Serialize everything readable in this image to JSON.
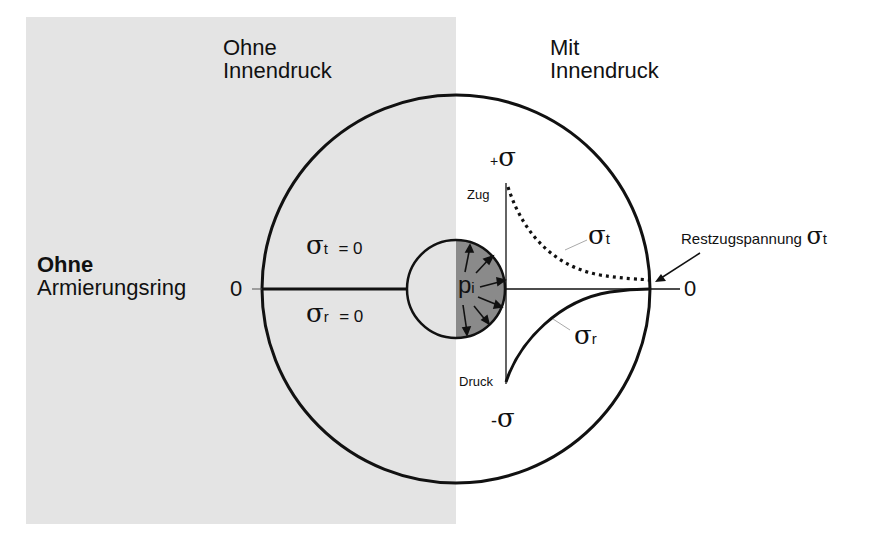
{
  "headers": {
    "left": {
      "line1": "Ohne",
      "line2": "Innendruck"
    },
    "right": {
      "line1": "Mit",
      "line2": "Innendruck"
    }
  },
  "side_label": {
    "bold": "Ohne",
    "normal": "Armierungsring"
  },
  "axis": {
    "zero_left": "0",
    "zero_right": "0",
    "plus_sign": "+",
    "minus_sign": "-",
    "sigma": "σ",
    "tension_label": "Zug",
    "compression_label": "Druck"
  },
  "left_half": {
    "sigma_t_eq": {
      "symbol": "σ",
      "sub": "t",
      "eq": "= 0"
    },
    "sigma_r_eq": {
      "symbol": "σ",
      "sub": "r",
      "eq": "= 0"
    }
  },
  "inner": {
    "pressure_symbol": "p",
    "pressure_sub": "i"
  },
  "curves": {
    "sigma_t": {
      "symbol": "σ",
      "sub": "t",
      "style": "dotted"
    },
    "sigma_r": {
      "symbol": "σ",
      "sub": "r",
      "style": "solid"
    }
  },
  "annotation": {
    "text": "Restzugspannung",
    "symbol": "σ",
    "sub": "t"
  },
  "colors": {
    "panel_grey": "#e4e4e4",
    "inner_fill": "#8a8a8a",
    "line": "#111111"
  }
}
